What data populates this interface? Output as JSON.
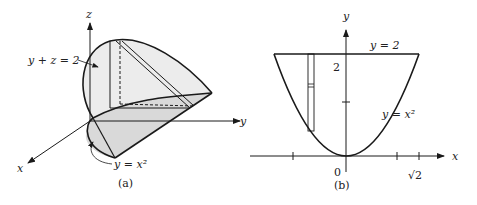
{
  "figure_a": {
    "caption": "(a)",
    "axes": {
      "x": "x",
      "y": "y",
      "z": "z"
    },
    "labels": {
      "plane": "y + z = 2",
      "cylinder": "y = x²"
    }
  },
  "figure_b": {
    "caption": "(b)",
    "axes": {
      "x": "x",
      "y": "y"
    },
    "labels": {
      "line": "y = 2",
      "curve": "y = x²",
      "tick_y": "2",
      "origin": "0",
      "tick_x": "√2"
    }
  },
  "colors": {
    "line": "#1a1a1a",
    "shade": "#d9d9d9",
    "shade_light": "#ececec"
  }
}
